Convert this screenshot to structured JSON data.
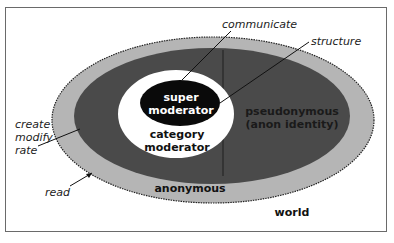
{
  "diagram": {
    "type": "nested-ellipse-access-levels",
    "colors": {
      "world_ring": "#b5b5b5",
      "identified_region": "#4a4a4a",
      "category_moderator": "#ffffff",
      "super_moderator": "#0a0a0a",
      "frame": "#6a6a6a"
    },
    "regions": {
      "world": "world",
      "anonymous": "anonymous",
      "pseudonymous_line1": "pseudonymous",
      "pseudonymous_line2": "(anon identity)",
      "category_moderator_line1": "category",
      "category_moderator_line2": "moderator",
      "super_moderator_line1": "super",
      "super_moderator_line2": "moderator"
    },
    "callouts": {
      "communicate": "communicate",
      "structure": "structure",
      "create": "create",
      "modify": "modify",
      "rate": "rate",
      "read": "read"
    }
  }
}
